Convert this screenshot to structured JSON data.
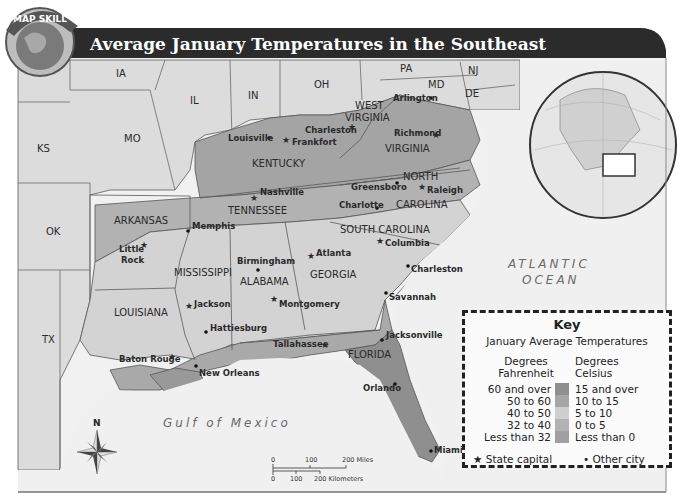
{
  "badge": {
    "label": "MAP SKILL"
  },
  "title": "Average January Temperatures in the Southeast",
  "states": {
    "IA": "IA",
    "IL": "IL",
    "IN": "IN",
    "OH": "OH",
    "PA": "PA",
    "NJ": "NJ",
    "MD": "MD",
    "DE": "DE",
    "KS": "KS",
    "MO": "MO",
    "OK": "OK",
    "TX": "TX",
    "WV1": "WEST",
    "WV2": "VIRGINIA",
    "VA": "VIRGINIA",
    "KY": "KENTUCKY",
    "TN": "TENNESSEE",
    "NC1": "NORTH",
    "NC2": "CAROLINA",
    "AR": "ARKANSAS",
    "SC": "SOUTH CAROLINA",
    "MS": "MISSISSIPPI",
    "AL": "ALABAMA",
    "GA": "GEORGIA",
    "LA": "LOUISIANA",
    "FL": "FLORIDA"
  },
  "cities": [
    {
      "name": "Louisville",
      "type": "city"
    },
    {
      "name": "Frankfort",
      "type": "capital"
    },
    {
      "name": "Charleston",
      "type": "capital"
    },
    {
      "name": "Arlington",
      "type": "city"
    },
    {
      "name": "Richmond",
      "type": "capital"
    },
    {
      "name": "Nashville",
      "type": "capital"
    },
    {
      "name": "Greensboro",
      "type": "city"
    },
    {
      "name": "Raleigh",
      "type": "capital"
    },
    {
      "name": "Charlotte",
      "type": "city"
    },
    {
      "name": "Memphis",
      "type": "city"
    },
    {
      "name": "Little",
      "type": "capital"
    },
    {
      "name": "Rock",
      "type": "capital"
    },
    {
      "name": "Columbia",
      "type": "capital"
    },
    {
      "name": "Birmingham",
      "type": "city"
    },
    {
      "name": "Atlanta",
      "type": "capital"
    },
    {
      "name": "Charleston",
      "type": "city"
    },
    {
      "name": "Jackson",
      "type": "capital"
    },
    {
      "name": "Montgomery",
      "type": "capital"
    },
    {
      "name": "Savannah",
      "type": "city"
    },
    {
      "name": "Hattiesburg",
      "type": "city"
    },
    {
      "name": "Jacksonville",
      "type": "city"
    },
    {
      "name": "Tallahassee",
      "type": "capital"
    },
    {
      "name": "Baton Rouge",
      "type": "capital"
    },
    {
      "name": "New Orleans",
      "type": "city"
    },
    {
      "name": "Orlando",
      "type": "city"
    },
    {
      "name": "Miami",
      "type": "city"
    }
  ],
  "water": {
    "atlantic1": "ATLANTIC",
    "atlantic2": "OCEAN",
    "gulf": "Gulf of Mexico"
  },
  "compass": {
    "north": "N"
  },
  "scale": {
    "mi0": "0",
    "mi100": "100",
    "mi200": "200 Miles",
    "km0": "0",
    "km100": "100",
    "km200": "200 Kilometers"
  },
  "key": {
    "title": "Key",
    "subtitle": "January Average Temperatures",
    "col_f": "Degrees Fahrenheit",
    "col_f1": "Degrees",
    "col_f2": "Fahrenheit",
    "col_c1": "Degrees",
    "col_c2": "Celsius",
    "rows": [
      {
        "f": "60 and over",
        "c": "15 and over",
        "color": "#8f8f8f"
      },
      {
        "f": "50 to 60",
        "c": "10 to 15",
        "color": "#a6a6a6"
      },
      {
        "f": "40 to 50",
        "c": "5 to 10",
        "color": "#cfcfcf"
      },
      {
        "f": "32 to  40",
        "c": "0 to 5",
        "color": "#b2b2b2"
      },
      {
        "f": "Less than 32",
        "c": "Less than 0",
        "color": "#a0a0a0"
      }
    ],
    "legend_capital": "State capital",
    "legend_city": "Other city"
  },
  "colors": {
    "non_region": "#dedede",
    "zone_60": "#8f8f8f",
    "zone_50": "#a9a9a9",
    "zone_40": "#d4d4d4",
    "zone_32": "#b4b4b4",
    "zone_lt32": "#a2a2a2",
    "water": "#f0f0f0",
    "title_bar": "#2b2b2b"
  }
}
